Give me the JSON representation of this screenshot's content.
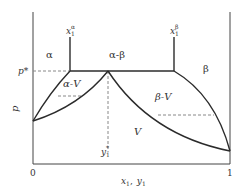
{
  "diagram": {
    "type": "phase-diagram",
    "axes": {
      "xlabel": "x1, y1",
      "xlabel_parts": {
        "x": "x",
        "x_sub": "1",
        "sep": ",",
        "y": "y",
        "y_sub": "1"
      },
      "ylabel": "p",
      "x_ticks": [
        "0",
        "1"
      ]
    },
    "regions": {
      "alpha": "α",
      "alpha_beta": "α-β",
      "beta": "β",
      "alpha_V": "α-V",
      "beta_V": "β-V",
      "V": "V"
    },
    "markers": {
      "p_star": "p*",
      "x1_alpha": {
        "base": "x",
        "sub": "1",
        "sup": "α"
      },
      "x1_beta": {
        "base": "x",
        "sub": "1",
        "sup": "β"
      },
      "y1_star": {
        "base": "y",
        "sub": "1",
        "sup": "*"
      }
    },
    "colors": {
      "line": "#2b2b2b",
      "dashed": "#888888",
      "text": "#333333"
    }
  }
}
